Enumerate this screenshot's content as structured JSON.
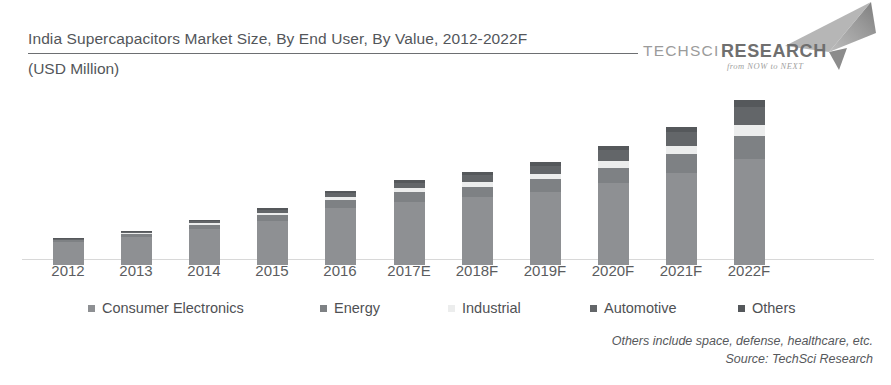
{
  "header": {
    "title_line1": "India Supercapacitors Market Size, By End User, By Value, 2012-2022F",
    "title_line2": "(USD Million)"
  },
  "logo": {
    "name_part1": "TECHSCI",
    "name_part2": "RESEARCH",
    "tagline": "from NOW to NEXT"
  },
  "footnotes": {
    "others_note": "Others include space, defense, healthcare, etc.",
    "source": "Source: TechSci Research"
  },
  "colors": {
    "consumer_electronics": "#8e9093",
    "energy": "#7e8184",
    "industrial": "#eceded",
    "automotive": "#636669",
    "others": "#55585b",
    "title_text": "#53565a",
    "baseline": "#d8d8d8"
  },
  "legend": {
    "items": [
      {
        "label": "Consumer Electronics",
        "color_key": "consumer_electronics",
        "left": 88
      },
      {
        "label": "Energy",
        "color_key": "energy",
        "left": 320
      },
      {
        "label": "Industrial",
        "color_key": "industrial",
        "left": 448
      },
      {
        "label": "Automotive",
        "color_key": "automotive",
        "left": 590
      },
      {
        "label": "Others",
        "color_key": "others",
        "left": 738
      }
    ]
  },
  "chart_data": {
    "type": "bar",
    "stacked": true,
    "title": "India Supercapacitors Market Size, By End User, By Value, 2012-2022F",
    "subtitle": "(USD Million)",
    "xlabel": "",
    "ylabel": "USD Million",
    "grid": false,
    "axis_visible": {
      "x": true,
      "y": false
    },
    "legend_position": "bottom",
    "categories": [
      "2012",
      "2013",
      "2014",
      "2015",
      "2016",
      "2017E",
      "2018F",
      "2019F",
      "2020F",
      "2021F",
      "2022F"
    ],
    "series": [
      {
        "name": "Consumer Electronics",
        "color_key": "consumer_electronics",
        "values": [
          23,
          29,
          36,
          45,
          55,
          62,
          70,
          80,
          92,
          104,
          116
        ]
      },
      {
        "name": "Energy",
        "color_key": "energy",
        "values": [
          2,
          3,
          4,
          6,
          7,
          9,
          11,
          14,
          17,
          21,
          25
        ]
      },
      {
        "name": "Industrial",
        "color_key": "industrial",
        "values": [
          1,
          1,
          2,
          2,
          3,
          4,
          5,
          6,
          8,
          10,
          13
        ]
      },
      {
        "name": "Automotive",
        "color_key": "automotive",
        "values": [
          1,
          1,
          2,
          3,
          4,
          5,
          7,
          9,
          12,
          15,
          19
        ]
      },
      {
        "name": "Others",
        "color_key": "others",
        "values": [
          0.5,
          1,
          1,
          2,
          2,
          3,
          3,
          4,
          5,
          6,
          8
        ]
      }
    ],
    "totals": [
      27.5,
      35,
      45,
      58,
      71,
      83,
      96,
      113,
      134,
      156,
      181
    ],
    "ylim": [
      0,
      190
    ],
    "pixel_geometry": {
      "baseline_y": 259,
      "bar_width": 31,
      "bar_centers": [
        68,
        136,
        204,
        272,
        340,
        409,
        477,
        545,
        613,
        681,
        749
      ],
      "bar_tops": [
        232,
        225,
        214,
        202,
        185,
        174,
        166,
        156,
        140,
        121,
        94
      ]
    }
  }
}
